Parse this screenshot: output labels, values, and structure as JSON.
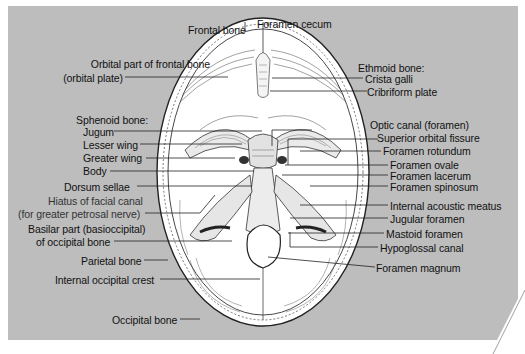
{
  "diagram": {
    "background_color": "#bdbdbd",
    "skull_fill": "#ffffff",
    "labels_top": [
      {
        "id": "frontal-bone",
        "text": "Frontal bone"
      },
      {
        "id": "foramen-cecum",
        "text": "Foramen cecum"
      }
    ],
    "labels_left": [
      {
        "id": "orbital-part",
        "text": "Orbital part of frontal bone"
      },
      {
        "id": "orbital-plate",
        "text": "(orbital plate)"
      },
      {
        "id": "sphenoid-heading",
        "text": "Sphenoid bone:"
      },
      {
        "id": "jugum",
        "text": "Jugum"
      },
      {
        "id": "lesser-wing",
        "text": "Lesser wing"
      },
      {
        "id": "greater-wing",
        "text": "Greater wing"
      },
      {
        "id": "body",
        "text": "Body"
      },
      {
        "id": "dorsum-sellae",
        "text": "Dorsum sellae"
      },
      {
        "id": "hiatus-facial-canal",
        "text": "Hiatus of facial canal"
      },
      {
        "id": "hiatus-sub",
        "text": "(for greater petrosal nerve)"
      },
      {
        "id": "basilar-part",
        "text": "Basilar part (basioccipital)"
      },
      {
        "id": "basilar-sub",
        "text": "of occipital bone"
      },
      {
        "id": "parietal-bone",
        "text": "Parietal bone"
      },
      {
        "id": "internal-occipital-crest",
        "text": "Internal occipital crest"
      },
      {
        "id": "occipital-bone",
        "text": "Occipital bone"
      }
    ],
    "labels_right": [
      {
        "id": "ethmoid-heading",
        "text": "Ethmoid bone:"
      },
      {
        "id": "crista-galli",
        "text": "Crista galli"
      },
      {
        "id": "cribriform-plate",
        "text": "Cribriform plate"
      },
      {
        "id": "optic-canal",
        "text": "Optic canal (foramen)"
      },
      {
        "id": "superior-orbital-fissure",
        "text": "Superior orbital fissure"
      },
      {
        "id": "foramen-rotundum",
        "text": "Foramen rotundum"
      },
      {
        "id": "foramen-ovale",
        "text": "Foramen ovale"
      },
      {
        "id": "foramen-lacerum",
        "text": "Foramen lacerum"
      },
      {
        "id": "foramen-spinosum",
        "text": "Foramen spinosum"
      },
      {
        "id": "internal-acoustic-meatus",
        "text": "Internal acoustic meatus"
      },
      {
        "id": "jugular-foramen",
        "text": "Jugular foramen"
      },
      {
        "id": "mastoid-foramen",
        "text": "Mastoid foramen"
      },
      {
        "id": "hypoglossal-canal",
        "text": "Hypoglossal canal"
      },
      {
        "id": "foramen-magnum",
        "text": "Foramen magnum"
      }
    ]
  }
}
